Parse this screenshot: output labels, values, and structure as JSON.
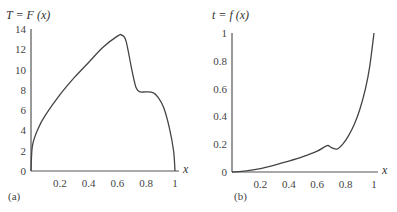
{
  "chart_data": [
    {
      "type": "line",
      "panel_label": "(a)",
      "title": "T = F (x)",
      "xlabel": "x",
      "ylabel": "T",
      "xlim": [
        0,
        1
      ],
      "ylim": [
        0,
        14
      ],
      "xticks": [
        "0.2",
        "0.4",
        "0.6",
        "0.8",
        "1"
      ],
      "yticks": [
        "0",
        "2",
        "4",
        "6",
        "8",
        "10",
        "12",
        "14"
      ],
      "grid": false,
      "x": [
        0,
        0.01,
        0.05,
        0.1,
        0.2,
        0.3,
        0.4,
        0.5,
        0.6,
        0.63,
        0.66,
        0.7,
        0.73,
        0.76,
        0.8,
        0.85,
        0.88,
        0.92,
        0.96,
        0.99,
        1.0
      ],
      "y": [
        0,
        2.5,
        4.2,
        5.5,
        7.5,
        9.2,
        10.7,
        12.2,
        13.3,
        13.4,
        12.8,
        10.0,
        8.2,
        7.8,
        7.8,
        7.7,
        7.3,
        6.3,
        4.3,
        2.0,
        0
      ]
    },
    {
      "type": "line",
      "panel_label": "(b)",
      "title": "t = f (x)",
      "xlabel": "x",
      "ylabel": "t",
      "xlim": [
        0,
        1
      ],
      "ylim": [
        0,
        1
      ],
      "xticks": [
        "0.2",
        "0.4",
        "0.6",
        "0.8",
        "1"
      ],
      "yticks": [
        "0",
        "0.2",
        "0.4",
        "0.6",
        "0.8",
        "1"
      ],
      "grid": false,
      "x": [
        0,
        0.1,
        0.2,
        0.3,
        0.4,
        0.5,
        0.6,
        0.67,
        0.7,
        0.74,
        0.78,
        0.82,
        0.86,
        0.9,
        0.94,
        0.97,
        1.0
      ],
      "y": [
        0,
        0.008,
        0.025,
        0.05,
        0.078,
        0.11,
        0.15,
        0.19,
        0.175,
        0.165,
        0.2,
        0.26,
        0.34,
        0.45,
        0.6,
        0.76,
        1.0
      ]
    }
  ],
  "panels": {
    "a": {
      "title": "T = F (x)",
      "label": "(a)",
      "x_axis_name": "x"
    },
    "b": {
      "title": "t = f (x)",
      "label": "(b)",
      "x_axis_name": "x"
    }
  }
}
